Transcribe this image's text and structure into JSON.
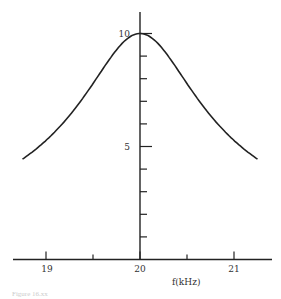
{
  "chart_data": {
    "type": "line",
    "title": "",
    "xlabel": "f(kHz)",
    "ylabel": "",
    "xlim": [
      18.7,
      21.4
    ],
    "ylim": [
      0,
      10.5
    ],
    "x_ticks": [
      19,
      19.5,
      20,
      20.5,
      21
    ],
    "x_tick_labels": [
      "19",
      "",
      "20",
      "",
      "21"
    ],
    "y_ticks": [
      1,
      2,
      3,
      4,
      5,
      6,
      7,
      8,
      9,
      10
    ],
    "y_tick_labels": {
      "5": "5",
      "10": "10"
    },
    "grid": false,
    "legend": null,
    "series": [
      {
        "name": "response",
        "x": [
          18.75,
          19.0,
          19.25,
          19.5,
          19.75,
          20.0,
          20.25,
          20.5,
          20.75,
          21.0,
          21.25
        ],
        "values": [
          3.8,
          4.6,
          5.7,
          7.0,
          8.9,
          10.0,
          8.9,
          7.0,
          5.7,
          4.6,
          3.8
        ]
      }
    ]
  },
  "axis": {
    "x_label": "f(kHz)",
    "x_tick_19": "19",
    "x_tick_20": "20",
    "x_tick_21": "21",
    "y_tick_5": "5",
    "y_tick_10": "10"
  },
  "caption": "Figure 16.xx"
}
